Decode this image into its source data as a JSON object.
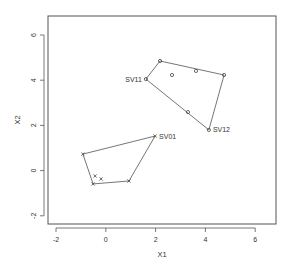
{
  "chart_data": {
    "type": "scatter",
    "title": "",
    "xlabel": "X1",
    "ylabel": "X2",
    "xlim": [
      -2.3,
      6.9
    ],
    "ylim": [
      -2.3,
      6.9
    ],
    "x_ticks": [
      -2,
      0,
      2,
      4,
      6
    ],
    "y_ticks": [
      -2,
      0,
      2,
      4,
      6
    ],
    "x_tick_labels": [
      "-2",
      "0",
      "2",
      "4",
      "6"
    ],
    "y_tick_labels": [
      "-2",
      "0",
      "2",
      "4",
      "6"
    ],
    "grid": false,
    "legend": null,
    "series": [
      {
        "name": "group-o",
        "marker": "o",
        "color": "#555555",
        "points": [
          {
            "x": 1.61,
            "y": 4.05,
            "label": "SV11"
          },
          {
            "x": 2.18,
            "y": 4.85,
            "label": ""
          },
          {
            "x": 2.66,
            "y": 4.23,
            "label": ""
          },
          {
            "x": 3.62,
            "y": 4.41,
            "label": ""
          },
          {
            "x": 4.75,
            "y": 4.23,
            "label": ""
          },
          {
            "x": 4.14,
            "y": 1.8,
            "label": "SV12"
          },
          {
            "x": 3.3,
            "y": 2.59,
            "label": ""
          }
        ],
        "hull": [
          0,
          1,
          4,
          5,
          0
        ]
      },
      {
        "name": "group-x",
        "marker": "x",
        "color": "#555555",
        "points": [
          {
            "x": 1.98,
            "y": 1.53,
            "label": "SV01"
          },
          {
            "x": -0.92,
            "y": 0.73,
            "label": ""
          },
          {
            "x": -0.51,
            "y": -0.59,
            "label": ""
          },
          {
            "x": 0.93,
            "y": -0.46,
            "label": ""
          },
          {
            "x": -0.43,
            "y": -0.24,
            "label": ""
          },
          {
            "x": -0.19,
            "y": -0.37,
            "label": ""
          }
        ],
        "hull": [
          0,
          1,
          2,
          3,
          0
        ]
      }
    ]
  },
  "layout": {
    "plot_box": {
      "left": 48,
      "top": 16,
      "right": 276,
      "bottom": 224
    },
    "x_px": {
      "at_minus2": 56,
      "per_unit": 24.9
    },
    "y_px": {
      "at_6": 35,
      "per_unit": 22.6
    },
    "colors": {
      "axis": "#555555",
      "line": "#666666",
      "marker": "#444444",
      "text": "#333333"
    }
  }
}
